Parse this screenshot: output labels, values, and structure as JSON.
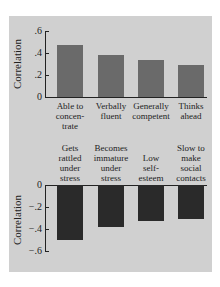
{
  "chart_data": [
    {
      "type": "bar",
      "title": "",
      "xlabel": "",
      "ylabel": "Correlation",
      "ylim": [
        0,
        0.6
      ],
      "yticks": [
        "0",
        ".2",
        ".4",
        ".6"
      ],
      "categories": [
        "Able to concen-trate",
        "Verbally fluent",
        "Generally competent",
        "Thinks ahead"
      ],
      "category_lines": [
        [
          "Able to",
          "concen-",
          "trate"
        ],
        [
          "Verbally",
          "fluent"
        ],
        [
          "Generally",
          "competent"
        ],
        [
          "Thinks",
          "ahead"
        ]
      ],
      "values": [
        0.47,
        0.38,
        0.34,
        0.29
      ],
      "bar_color": "#6a6a6a",
      "grid": false
    },
    {
      "type": "bar",
      "title": "",
      "xlabel": "",
      "ylabel": "Correlation",
      "ylim": [
        -0.6,
        0
      ],
      "yticks": [
        "0",
        "-.2",
        "-.4",
        "-.6"
      ],
      "categories": [
        "Gets rattled under stress",
        "Becomes immature under stress",
        "Low self-esteem",
        "Slow to make social contacts"
      ],
      "category_lines": [
        [
          "Gets",
          "rattled",
          "under",
          "stress"
        ],
        [
          "Becomes",
          "immature",
          "under",
          "stress"
        ],
        [
          "Low",
          "self-",
          "esteem"
        ],
        [
          "Slow to",
          "make",
          "social",
          "contacts"
        ]
      ],
      "values": [
        -0.5,
        -0.38,
        -0.33,
        -0.31
      ],
      "bar_color": "#2a2a2a",
      "grid": false
    }
  ]
}
